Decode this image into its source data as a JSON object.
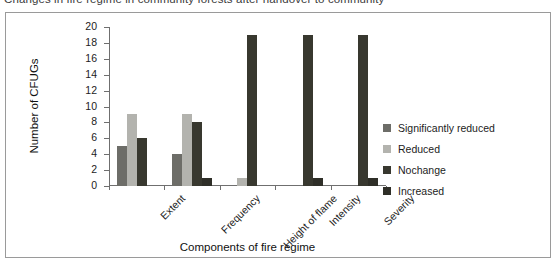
{
  "caption": "Changes in fire regime in community forests after handover to community",
  "chart_data": {
    "type": "bar",
    "title": "Changes in fire regime in community forests after handover to community",
    "xlabel": "Components of fire regime",
    "ylabel": "Number of CFUGs",
    "ylim": [
      0,
      20
    ],
    "ytick_step": 2,
    "yticks": [
      "20",
      "18",
      "16",
      "14",
      "12",
      "10",
      "8",
      "6",
      "4",
      "2",
      "0"
    ],
    "grid": false,
    "legend_position": "right",
    "categories": [
      "Extent",
      "Frequency",
      "Height of flame",
      "Intensity",
      "Severity"
    ],
    "series": [
      {
        "name": "Significantly reduced",
        "color": "#6d6d68",
        "values": [
          5,
          4,
          0,
          0,
          0
        ]
      },
      {
        "name": "Reduced",
        "color": "#b3b3ae",
        "values": [
          9,
          9,
          1,
          0,
          0
        ]
      },
      {
        "name": "Nochange",
        "color": "#38382f",
        "values": [
          6,
          8,
          19,
          19,
          19
        ]
      },
      {
        "name": "Increased",
        "color": "#2f2f28",
        "values": [
          0,
          1,
          0,
          1,
          1
        ]
      }
    ]
  }
}
